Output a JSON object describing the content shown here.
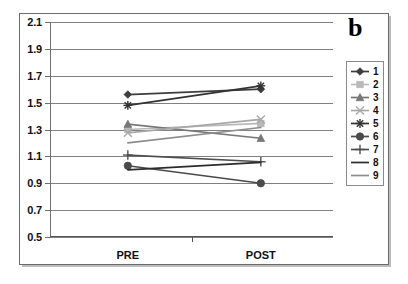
{
  "panel": {
    "letter": "b"
  },
  "chart_data": {
    "type": "line",
    "title": "b",
    "xlabel": "",
    "ylabel": "",
    "categories": [
      "PRE",
      "POST"
    ],
    "x_tick_labels": [
      "PRE",
      "POST"
    ],
    "y_tick_labels": [
      "0.5",
      "0.7",
      "0.9",
      "1.1",
      "1.3",
      "1.5",
      "1.7",
      "1.9",
      "2.1"
    ],
    "y_ticks": [
      0.5,
      0.7,
      0.9,
      1.1,
      1.3,
      1.5,
      1.7,
      1.9,
      2.1
    ],
    "ylim": [
      0.5,
      2.1
    ],
    "grid": true,
    "legend_position": "right",
    "series": [
      {
        "name": "1",
        "values": [
          1.56,
          1.6
        ],
        "marker": "diamond",
        "color": "#3d3d3d"
      },
      {
        "name": "2",
        "values": [
          1.3,
          1.345
        ],
        "marker": "square",
        "color": "#b9b9b9"
      },
      {
        "name": "3",
        "values": [
          1.34,
          1.235
        ],
        "marker": "triangle",
        "color": "#777777"
      },
      {
        "name": "4",
        "values": [
          1.275,
          1.375
        ],
        "marker": "x",
        "color": "#a8a8a8"
      },
      {
        "name": "5",
        "values": [
          1.48,
          1.625
        ],
        "marker": "asterisk",
        "color": "#333333"
      },
      {
        "name": "6",
        "values": [
          1.03,
          0.9
        ],
        "marker": "circle",
        "color": "#4a4a4a"
      },
      {
        "name": "7",
        "values": [
          1.11,
          1.06
        ],
        "marker": "plus",
        "color": "#4f4f4f"
      },
      {
        "name": "8",
        "values": [
          1.0,
          1.055
        ],
        "marker": "none",
        "color": "#2b2b2b"
      },
      {
        "name": "9",
        "values": [
          1.2,
          1.315
        ],
        "marker": "none",
        "color": "#8d8d8d"
      }
    ]
  },
  "legend": {
    "items": [
      {
        "label": "1"
      },
      {
        "label": "2"
      },
      {
        "label": "3"
      },
      {
        "label": "4"
      },
      {
        "label": "5"
      },
      {
        "label": "6"
      },
      {
        "label": "7"
      },
      {
        "label": "8"
      },
      {
        "label": "9"
      }
    ]
  }
}
